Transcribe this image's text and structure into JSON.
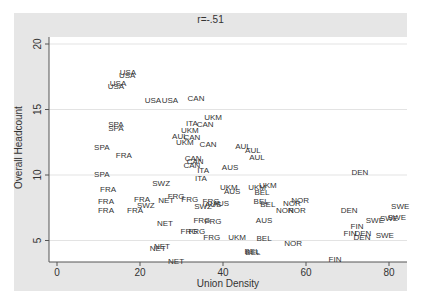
{
  "chart_data": {
    "type": "scatter",
    "title": "r=-.51",
    "xlabel": "Union Density",
    "ylabel": "Overall Headcount",
    "xlim": [
      -2,
      84
    ],
    "ylim": [
      3.5,
      20.6
    ],
    "xticks": [
      0,
      20,
      40,
      60,
      80
    ],
    "yticks": [
      5,
      10,
      15,
      20
    ],
    "grid": {
      "y": true,
      "x": false
    },
    "marker": "text-label",
    "colors": {
      "frame_bg": "#e6e6e6",
      "plot_bg": "#ffffff",
      "grid": "#e8e8e8",
      "label": "#333333",
      "axis": "#555555"
    },
    "points": [
      {
        "label": "USA",
        "x": 17.1,
        "y": 17.9
      },
      {
        "label": "USA",
        "x": 16.9,
        "y": 17.6
      },
      {
        "label": "USA",
        "x": 14.7,
        "y": 17.0
      },
      {
        "label": "USA",
        "x": 14.2,
        "y": 16.8
      },
      {
        "label": "USA",
        "x": 23.1,
        "y": 15.7
      },
      {
        "label": "USA",
        "x": 27.2,
        "y": 15.7
      },
      {
        "label": "CAN",
        "x": 33.5,
        "y": 15.9
      },
      {
        "label": "UKM",
        "x": 37.6,
        "y": 14.4
      },
      {
        "label": "SPA",
        "x": 14.2,
        "y": 13.9
      },
      {
        "label": "SPA",
        "x": 14.2,
        "y": 13.6
      },
      {
        "label": "ITA",
        "x": 32.5,
        "y": 14.0
      },
      {
        "label": "CAN",
        "x": 35.7,
        "y": 13.9
      },
      {
        "label": "UKM",
        "x": 32.0,
        "y": 13.4
      },
      {
        "label": "AUL",
        "x": 29.6,
        "y": 13.0
      },
      {
        "label": "CAN",
        "x": 32.5,
        "y": 12.9
      },
      {
        "label": "UKM",
        "x": 30.8,
        "y": 12.5
      },
      {
        "label": "CAN",
        "x": 36.4,
        "y": 12.4
      },
      {
        "label": "AUL",
        "x": 44.8,
        "y": 12.2
      },
      {
        "label": "AUL",
        "x": 47.2,
        "y": 11.9
      },
      {
        "label": "AUL",
        "x": 48.2,
        "y": 11.4
      },
      {
        "label": "SPA",
        "x": 10.8,
        "y": 12.1
      },
      {
        "label": "FRA",
        "x": 16.1,
        "y": 11.5
      },
      {
        "label": "CAN",
        "x": 32.8,
        "y": 11.3
      },
      {
        "label": "CAN",
        "x": 33.3,
        "y": 11.1
      },
      {
        "label": "CAN",
        "x": 32.5,
        "y": 10.8
      },
      {
        "label": "AUS",
        "x": 41.7,
        "y": 10.6
      },
      {
        "label": "ITA",
        "x": 35.2,
        "y": 10.4
      },
      {
        "label": "ITA",
        "x": 34.7,
        "y": 9.8
      },
      {
        "label": "SPA",
        "x": 10.8,
        "y": 10.1
      },
      {
        "label": "DEN",
        "x": 73.0,
        "y": 10.2
      },
      {
        "label": "SWZ",
        "x": 25.1,
        "y": 9.4
      },
      {
        "label": "FRA",
        "x": 12.3,
        "y": 8.9
      },
      {
        "label": "UKM",
        "x": 41.4,
        "y": 9.1
      },
      {
        "label": "AUS",
        "x": 42.2,
        "y": 8.8
      },
      {
        "label": "UKM",
        "x": 48.2,
        "y": 9.1
      },
      {
        "label": "UKM",
        "x": 50.8,
        "y": 9.2
      },
      {
        "label": "BEL",
        "x": 49.4,
        "y": 8.7
      },
      {
        "label": "FRA",
        "x": 11.8,
        "y": 8.0
      },
      {
        "label": "FRA",
        "x": 11.8,
        "y": 7.3
      },
      {
        "label": "FRA",
        "x": 20.5,
        "y": 8.2
      },
      {
        "label": "FRA",
        "x": 18.8,
        "y": 7.3
      },
      {
        "label": "SWZ",
        "x": 21.4,
        "y": 7.7
      },
      {
        "label": "FRG",
        "x": 28.7,
        "y": 8.4
      },
      {
        "label": "NET",
        "x": 26.3,
        "y": 8.1
      },
      {
        "label": "FRG",
        "x": 32.0,
        "y": 8.2
      },
      {
        "label": "FRG",
        "x": 37.1,
        "y": 8.0
      },
      {
        "label": "SWZ",
        "x": 35.2,
        "y": 7.6
      },
      {
        "label": "AUS",
        "x": 37.6,
        "y": 7.8
      },
      {
        "label": "AUS",
        "x": 39.5,
        "y": 7.9
      },
      {
        "label": "BEL",
        "x": 49.2,
        "y": 8.0
      },
      {
        "label": "BEL",
        "x": 50.8,
        "y": 7.8
      },
      {
        "label": "NOR",
        "x": 58.6,
        "y": 8.1
      },
      {
        "label": "NOR",
        "x": 56.6,
        "y": 7.9
      },
      {
        "label": "NOR",
        "x": 54.9,
        "y": 7.3
      },
      {
        "label": "NOR",
        "x": 57.8,
        "y": 7.3
      },
      {
        "label": "DEN",
        "x": 70.4,
        "y": 7.3
      },
      {
        "label": "SWE",
        "x": 82.7,
        "y": 7.6
      },
      {
        "label": "SWE",
        "x": 76.6,
        "y": 6.6
      },
      {
        "label": "SWE",
        "x": 80.0,
        "y": 6.7
      },
      {
        "label": "SWE",
        "x": 81.9,
        "y": 6.8
      },
      {
        "label": "NET",
        "x": 26.0,
        "y": 6.3
      },
      {
        "label": "FRG",
        "x": 34.9,
        "y": 6.6
      },
      {
        "label": "FRG",
        "x": 37.6,
        "y": 6.5
      },
      {
        "label": "AUS",
        "x": 49.9,
        "y": 6.6
      },
      {
        "label": "FRG",
        "x": 31.8,
        "y": 5.7
      },
      {
        "label": "FRG",
        "x": 33.7,
        "y": 5.7
      },
      {
        "label": "FRG",
        "x": 37.3,
        "y": 5.3
      },
      {
        "label": "UKM",
        "x": 43.4,
        "y": 5.3
      },
      {
        "label": "BEL",
        "x": 49.9,
        "y": 5.2
      },
      {
        "label": "NOR",
        "x": 56.9,
        "y": 4.8
      },
      {
        "label": "FIN",
        "x": 70.6,
        "y": 5.6
      },
      {
        "label": "FIN",
        "x": 72.3,
        "y": 6.1
      },
      {
        "label": "DEN",
        "x": 73.5,
        "y": 5.3
      },
      {
        "label": "DEN",
        "x": 73.7,
        "y": 5.6
      },
      {
        "label": "SWE",
        "x": 79.0,
        "y": 5.4
      },
      {
        "label": "NET",
        "x": 24.3,
        "y": 4.4
      },
      {
        "label": "NET",
        "x": 25.3,
        "y": 4.6
      },
      {
        "label": "BEL",
        "x": 47.0,
        "y": 4.2
      },
      {
        "label": "BEL",
        "x": 47.2,
        "y": 4.1
      },
      {
        "label": "NET",
        "x": 28.7,
        "y": 3.4
      },
      {
        "label": "FIN",
        "x": 67.0,
        "y": 3.6
      }
    ]
  }
}
